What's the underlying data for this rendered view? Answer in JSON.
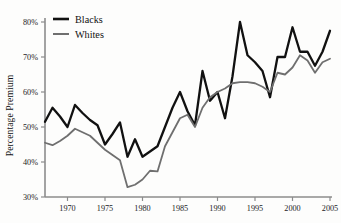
{
  "chart_data": {
    "type": "line",
    "title": "",
    "xlabel": "",
    "ylabel": "Percentage Premium",
    "xlim": [
      1967,
      2005
    ],
    "ylim": [
      30,
      80
    ],
    "grid": false,
    "legend_position": "top-left",
    "y_tick_labels": [
      "30%",
      "40%",
      "50%",
      "60%",
      "70%",
      "80%"
    ],
    "y_ticks": [
      30,
      40,
      50,
      60,
      70,
      80
    ],
    "x_tick_labels": [
      "1970",
      "1975",
      "1980",
      "1985",
      "1990",
      "1995",
      "2000",
      "2005"
    ],
    "x_ticks": [
      1970,
      1975,
      1980,
      1985,
      1990,
      1995,
      2000,
      2005
    ],
    "x": [
      1967,
      1968,
      1969,
      1970,
      1971,
      1972,
      1973,
      1974,
      1975,
      1976,
      1977,
      1978,
      1979,
      1980,
      1981,
      1982,
      1983,
      1984,
      1985,
      1986,
      1987,
      1988,
      1989,
      1990,
      1991,
      1992,
      1993,
      1994,
      1995,
      1996,
      1997,
      1998,
      1999,
      2000,
      2001,
      2002,
      2003,
      2004,
      2005
    ],
    "series": [
      {
        "name": "Blacks",
        "color": "#111111",
        "width": 2.3,
        "values": [
          51.5,
          55.5,
          53.0,
          50.0,
          56.3,
          54.0,
          52.0,
          50.5,
          45.0,
          48.0,
          51.3,
          41.5,
          46.5,
          41.5,
          43.0,
          44.5,
          50.0,
          55.5,
          60.0,
          54.5,
          50.5,
          66.0,
          57.5,
          60.0,
          52.5,
          64.5,
          80.0,
          70.5,
          68.5,
          66.0,
          58.5,
          70.0,
          70.0,
          78.5,
          71.5,
          71.5,
          67.5,
          71.5,
          77.5
        ]
      },
      {
        "name": "Whites",
        "color": "#6f6f6f",
        "width": 1.8,
        "values": [
          45.5,
          44.8,
          46.0,
          47.5,
          49.5,
          48.5,
          47.5,
          45.5,
          43.5,
          42.0,
          40.5,
          32.8,
          33.5,
          35.0,
          37.5,
          37.3,
          44.5,
          48.5,
          52.5,
          53.5,
          50.0,
          55.5,
          58.5,
          60.0,
          61.0,
          62.5,
          62.8,
          62.8,
          62.5,
          61.5,
          60.0,
          65.5,
          65.0,
          67.0,
          70.5,
          69.0,
          65.5,
          68.5,
          69.5
        ]
      }
    ]
  },
  "legend": {
    "items": [
      {
        "label": "Blacks",
        "color": "#111111"
      },
      {
        "label": "Whites",
        "color": "#6f6f6f"
      }
    ]
  },
  "axes": {
    "y_axis_title": "Percentage Premium"
  }
}
